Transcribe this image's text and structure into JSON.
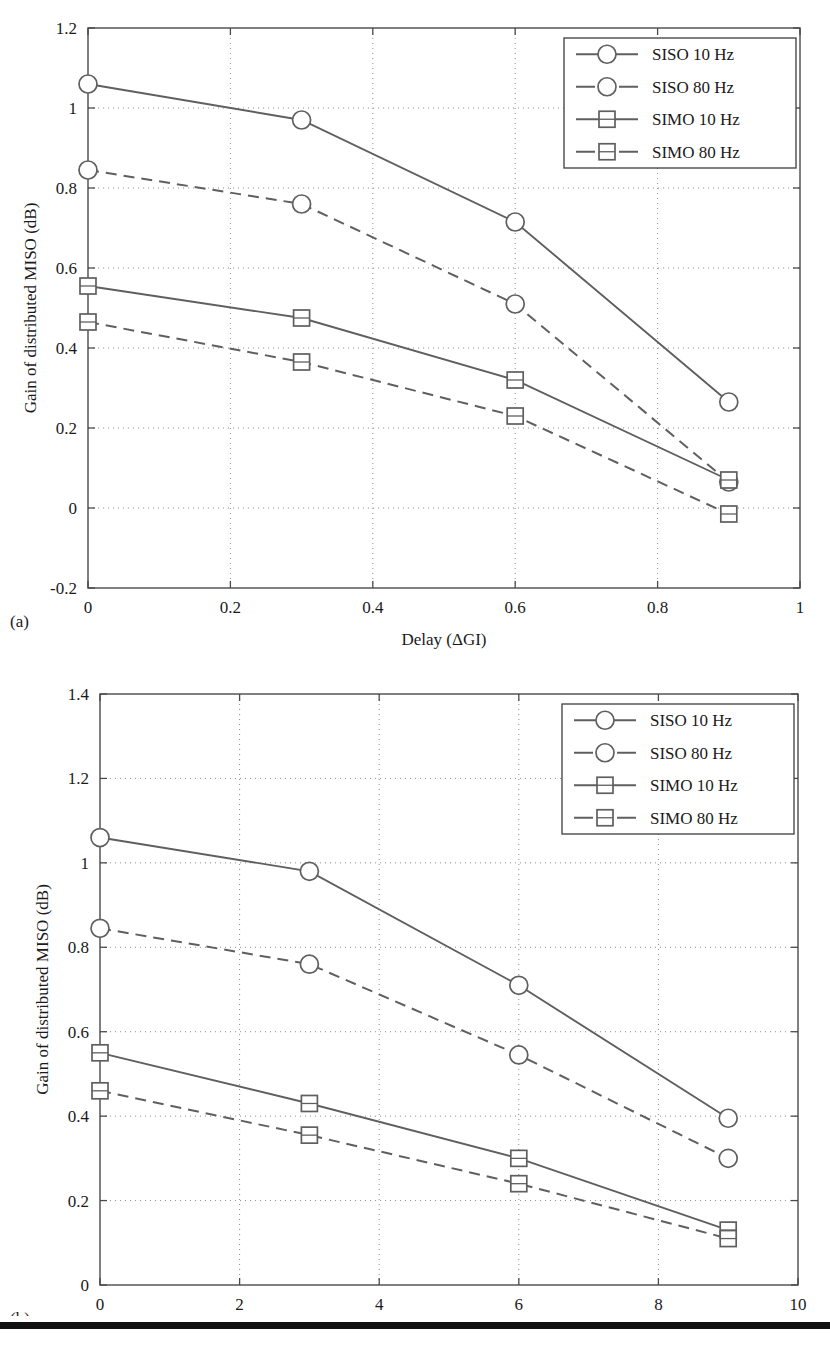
{
  "figure": {
    "panel_a_caption": "(a)",
    "panel_b_caption": "(b)"
  },
  "chart_data": [
    {
      "panel": "(a)",
      "type": "line",
      "title": "",
      "xlabel": "Delay (ΔGI)",
      "ylabel": "Gain of distributed MISO (dB)",
      "xlim": [
        0,
        1
      ],
      "ylim": [
        -0.2,
        1.2
      ],
      "xticks": [
        0,
        0.2,
        0.4,
        0.6,
        0.8,
        1
      ],
      "xticklabels": [
        "0",
        "0.2",
        "0.4",
        "0.6",
        "0.8",
        "1"
      ],
      "yticks": [
        -0.2,
        0,
        0.2,
        0.4,
        0.6,
        0.8,
        1,
        1.2
      ],
      "yticklabels": [
        "-0.2",
        "0",
        "0.2",
        "0.4",
        "0.6",
        "0.8",
        "1",
        "1.2"
      ],
      "grid": true,
      "legend_position": "upper right",
      "x": [
        0,
        0.3,
        0.6,
        0.9
      ],
      "series": [
        {
          "name": "SISO 10 Hz",
          "marker": "circle",
          "linestyle": "solid",
          "values": [
            1.06,
            0.97,
            0.715,
            0.265
          ]
        },
        {
          "name": "SISO 80 Hz",
          "marker": "circle",
          "linestyle": "dashed",
          "values": [
            0.845,
            0.76,
            0.51,
            0.065
          ]
        },
        {
          "name": "SIMO 10 Hz",
          "marker": "square",
          "linestyle": "solid",
          "values": [
            0.555,
            0.475,
            0.32,
            0.07
          ]
        },
        {
          "name": "SIMO 80 Hz",
          "marker": "square",
          "linestyle": "dashed",
          "values": [
            0.465,
            0.365,
            0.23,
            -0.015
          ]
        }
      ]
    },
    {
      "panel": "(b)",
      "type": "line",
      "title": "",
      "xlabel": "Power imbalance (dB)",
      "ylabel": "Gain of distributed MISO (dB)",
      "xlim": [
        0,
        10
      ],
      "ylim": [
        0,
        1.4
      ],
      "xticks": [
        0,
        2,
        4,
        6,
        8,
        10
      ],
      "xticklabels": [
        "0",
        "2",
        "4",
        "6",
        "8",
        "10"
      ],
      "yticks": [
        0,
        0.2,
        0.4,
        0.6,
        0.8,
        1,
        1.2,
        1.4
      ],
      "yticklabels": [
        "0",
        "0.2",
        "0.4",
        "0.6",
        "0.8",
        "1",
        "1.2",
        "1.4"
      ],
      "grid": true,
      "legend_position": "upper right",
      "x": [
        0,
        3,
        6,
        9
      ],
      "series": [
        {
          "name": "SISO 10 Hz",
          "marker": "circle",
          "linestyle": "solid",
          "values": [
            1.06,
            0.98,
            0.71,
            0.395
          ]
        },
        {
          "name": "SISO 80 Hz",
          "marker": "circle",
          "linestyle": "dashed",
          "values": [
            0.845,
            0.76,
            0.545,
            0.3
          ]
        },
        {
          "name": "SIMO 10 Hz",
          "marker": "square",
          "linestyle": "solid",
          "values": [
            0.55,
            0.43,
            0.3,
            0.13
          ]
        },
        {
          "name": "SIMO 80 Hz",
          "marker": "square",
          "linestyle": "dashed",
          "values": [
            0.46,
            0.355,
            0.24,
            0.11
          ]
        }
      ]
    }
  ],
  "colors": {
    "line": "#5f5f5f",
    "axis": "#4a4a4a",
    "grid": "#8c8c8c",
    "text": "#1a1a1a",
    "rule": "#111111"
  }
}
